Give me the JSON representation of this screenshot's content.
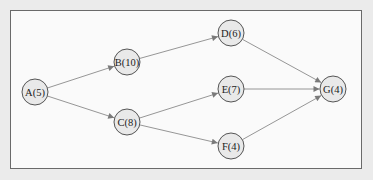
{
  "diagram": {
    "type": "activity-network",
    "nodes": [
      {
        "id": "A",
        "label": "A(5)",
        "duration": 5,
        "cx": 35,
        "cy": 92
      },
      {
        "id": "B",
        "label": "B(10)",
        "duration": 10,
        "cx": 127,
        "cy": 62
      },
      {
        "id": "C",
        "label": "C(8)",
        "duration": 8,
        "cx": 127,
        "cy": 122
      },
      {
        "id": "D",
        "label": "D(6)",
        "duration": 6,
        "cx": 231,
        "cy": 33
      },
      {
        "id": "E",
        "label": "E(7)",
        "duration": 7,
        "cx": 231,
        "cy": 89
      },
      {
        "id": "F",
        "label": "F(4)",
        "duration": 4,
        "cx": 231,
        "cy": 146
      },
      {
        "id": "G",
        "label": "G(4)",
        "duration": 4,
        "cx": 333,
        "cy": 89
      }
    ],
    "edges": [
      {
        "from": "A",
        "to": "B"
      },
      {
        "from": "A",
        "to": "C"
      },
      {
        "from": "B",
        "to": "D"
      },
      {
        "from": "C",
        "to": "E"
      },
      {
        "from": "C",
        "to": "F"
      },
      {
        "from": "D",
        "to": "G"
      },
      {
        "from": "E",
        "to": "G"
      },
      {
        "from": "F",
        "to": "G"
      }
    ],
    "node_radius": 13,
    "colors": {
      "node_fill": "#e9e9e9",
      "node_stroke": "#555555",
      "edge": "#8a8a8a",
      "frame_bg": "#fafafa",
      "page_bg": "#ebebeb"
    }
  }
}
